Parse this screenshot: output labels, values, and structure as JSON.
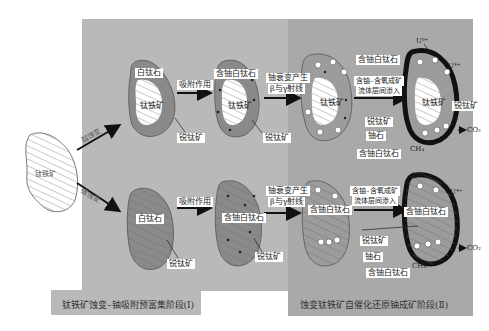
{
  "diagram": {
    "source": {
      "label": "钛铁矿"
    },
    "branches": [
      {
        "label": "弱蚀变"
      },
      {
        "label": "强蚀变"
      }
    ],
    "rows": [
      {
        "stage1": {
          "outer": "白钛石",
          "core": "钛铁矿",
          "pointer": "锐钛矿"
        },
        "arrow1": "吸附作用",
        "stage2": {
          "outer": "含铀白钛石",
          "core": "钛铁矿",
          "pointer": "锐钛矿"
        },
        "arrow2_line1": "铀衰变产生",
        "arrow2_line2": "β与γ射线",
        "stage3": {
          "label_top": "含铀白钛石",
          "core": "钛铁矿",
          "pointer": "锐钛矿"
        },
        "arrow3_line1": "含铀–含氧成矿",
        "arrow3_line2": "流体层间渗入",
        "stage4": {
          "core": "钛铁矿",
          "u6": "U⁶⁺",
          "u4": "U⁴⁺",
          "right": "锐钛矿",
          "co2": "CO₂",
          "ch4": "CH₄",
          "bottom1": "铀石",
          "bottom2": "含铀白钛石"
        }
      },
      {
        "stage1": {
          "outer": "白钛石",
          "pointer": "锐钛矿"
        },
        "arrow1": "吸附作用",
        "stage2": {
          "outer": "含铀白钛石",
          "pointer": "锐钛矿"
        },
        "arrow2_line1": "铀衰变产生",
        "arrow2_line2": "β与γ射线",
        "stage3": {
          "outer": "含铀白钛石"
        },
        "arrow3_line1": "含铀–含氧成矿",
        "arrow3_line2": "流体层间渗入",
        "stage4": {
          "outer": "含铀白钛石",
          "u6": "U⁶⁺",
          "u4": "U⁴⁺",
          "pointer": "锐钛矿",
          "co2": "CO₂",
          "ch4": "CH₄",
          "bottom1": "铀石",
          "bottom2": "含铀白钛石"
        }
      }
    ],
    "captions": {
      "phase1": "钛铁矿蚀变–铀吸附预富集阶段(Ⅰ)",
      "phase2": "蚀变钛铁矿自催化还原铀成矿阶段(Ⅱ)"
    },
    "colors": {
      "panel1_bg": "#b9b9b9",
      "panel2_bg": "#a9a9a9",
      "grain_fill": "#8a8a8a",
      "rim": "#111111"
    }
  }
}
